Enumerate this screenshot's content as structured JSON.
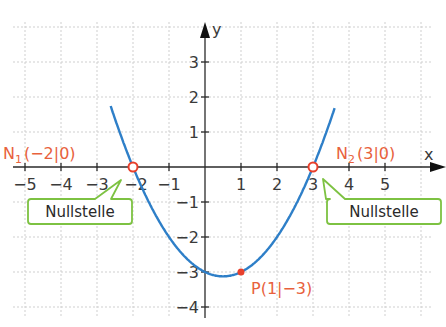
{
  "colors": {
    "curve": "#2e7fc8",
    "grid": "#c8c8c8",
    "axis": "#2a2a2a",
    "point_label": "#e8613c",
    "callout_border": "#7dc242"
  },
  "axes": {
    "x_label": "x",
    "y_label": "y",
    "x_ticks": [
      "−5",
      "−4",
      "−3",
      "−2",
      "−1",
      "1",
      "2",
      "3",
      "4",
      "5"
    ],
    "y_ticks": [
      "3",
      "2",
      "1",
      "−1",
      "−2",
      "−3",
      "−4"
    ]
  },
  "points": {
    "n1": {
      "name": "N",
      "sub": "1",
      "coords": "(−2|0)"
    },
    "n2": {
      "name": "N",
      "sub": "2",
      "coords": "(3|0)"
    },
    "p": {
      "label": "P(1|−3)"
    }
  },
  "callouts": {
    "left": "Nullstelle",
    "right": "Nullstelle"
  },
  "chart_data": {
    "type": "line",
    "title": "",
    "function": "f(x) = 0.5x² − 0.5x − 3",
    "xlabel": "x",
    "ylabel": "y",
    "xlim": [
      -5.5,
      6.7
    ],
    "ylim": [
      -4.3,
      4.2
    ],
    "grid": true,
    "series": [
      {
        "name": "Parabel",
        "x": [
          -2.6,
          -2,
          -1,
          0,
          0.5,
          1,
          2,
          3,
          3.6
        ],
        "y": [
          1.68,
          0,
          -2,
          -3,
          -3.125,
          -3,
          -2,
          0,
          1.68
        ]
      }
    ],
    "annotations": [
      {
        "text": "N1(−2|0)",
        "x": -2,
        "y": 0,
        "marker": "open-circle"
      },
      {
        "text": "N2(3|0)",
        "x": 3,
        "y": 0,
        "marker": "open-circle"
      },
      {
        "text": "P(1|−3)",
        "x": 1,
        "y": -3,
        "marker": "filled-dot"
      },
      {
        "text": "Nullstelle",
        "points_to": [
          -2,
          0
        ]
      },
      {
        "text": "Nullstelle",
        "points_to": [
          3,
          0
        ]
      }
    ]
  }
}
